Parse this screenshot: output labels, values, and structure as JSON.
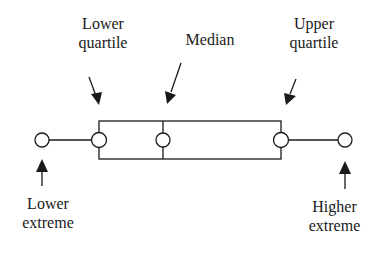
{
  "diagram": {
    "type": "box-and-whisker-plot",
    "labels": {
      "lower_quartile": [
        "Lower",
        "quartile"
      ],
      "median": [
        "Median"
      ],
      "upper_quartile": [
        "Upper",
        "quartile"
      ],
      "lower_extreme": [
        "Lower",
        "extreme"
      ],
      "higher_extreme": [
        "Higher",
        "extreme"
      ]
    },
    "points": [
      {
        "name": "lower_extreme",
        "x": 42
      },
      {
        "name": "lower_quartile",
        "x": 99
      },
      {
        "name": "median",
        "x": 163
      },
      {
        "name": "upper_quartile",
        "x": 281
      },
      {
        "name": "higher_extreme",
        "x": 345
      }
    ],
    "colors": {
      "stroke": "#1a1a1a",
      "background": "#ffffff"
    }
  }
}
